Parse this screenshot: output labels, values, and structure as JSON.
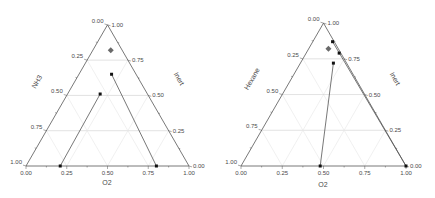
{
  "chart_data": [
    {
      "type": "scatter",
      "subtype": "ternary",
      "title": "",
      "axes": {
        "bottom": {
          "label": "O2",
          "ticks": [
            "0.00",
            "0.25",
            "0.50",
            "0.75",
            "1.00"
          ],
          "direction": "left-to-right"
        },
        "left": {
          "label": "NH3",
          "ticks": [
            "0.00",
            "0.25",
            "0.50",
            "0.75",
            "1.00"
          ],
          "direction": "top-to-bottom"
        },
        "right": {
          "label": "Inert",
          "ticks": [
            "1.00",
            "0.75",
            "0.50",
            "0.25",
            "0.00"
          ],
          "direction": "top-to-bottom"
        }
      },
      "grid": true,
      "points": [
        {
          "marker": "diamond",
          "Inert": 0.82,
          "O2": 0.11,
          "NH3": 0.07
        },
        {
          "marker": "square",
          "Inert": 0.65,
          "O2": 0.2,
          "NH3": 0.15
        },
        {
          "marker": "square",
          "Inert": 0.51,
          "O2": 0.2,
          "NH3": 0.29
        },
        {
          "marker": "square",
          "Inert": 0.0,
          "O2": 0.21,
          "NH3": 0.79
        },
        {
          "marker": "square",
          "Inert": 0.0,
          "O2": 0.8,
          "NH3": 0.2
        }
      ],
      "lines": [
        {
          "from": 2,
          "to": 3
        },
        {
          "from": 1,
          "to": 4
        }
      ]
    },
    {
      "type": "scatter",
      "subtype": "ternary",
      "title": "",
      "axes": {
        "bottom": {
          "label": "O2",
          "ticks": [
            "0.00",
            "0.25",
            "0.50",
            "0.75",
            "1.00"
          ],
          "direction": "left-to-right"
        },
        "left": {
          "label": "Hexane",
          "ticks": [
            "0.00",
            "0.25",
            "0.50",
            "0.75",
            "1.00"
          ],
          "direction": "top-to-bottom"
        },
        "right": {
          "label": "Inert",
          "ticks": [
            "1.00",
            "0.75",
            "0.50",
            "0.25",
            "0.00"
          ],
          "direction": "top-to-bottom"
        }
      },
      "grid": true,
      "points": [
        {
          "marker": "square",
          "Inert": 0.87,
          "O2": 0.12,
          "Hexane": 0.01
        },
        {
          "marker": "diamond",
          "Inert": 0.82,
          "O2": 0.12,
          "Hexane": 0.06
        },
        {
          "marker": "square",
          "Inert": 0.79,
          "O2": 0.2,
          "Hexane": 0.01
        },
        {
          "marker": "square",
          "Inert": 0.72,
          "O2": 0.2,
          "Hexane": 0.08
        },
        {
          "marker": "square",
          "Inert": 0.0,
          "O2": 0.48,
          "Hexane": 0.52
        },
        {
          "marker": "square",
          "Inert": 0.0,
          "O2": 1.0,
          "Hexane": 0.0
        }
      ],
      "lines": [
        {
          "from": 3,
          "to": 4
        },
        {
          "from": 0,
          "to": 5
        }
      ]
    }
  ],
  "colors": {
    "frame": "#555555",
    "grid_major": "#cfcfcf",
    "grid_minor": "#e6e6e6",
    "data_line": "#555555",
    "marker": "#111111",
    "diamond": "#6a6a6a"
  }
}
